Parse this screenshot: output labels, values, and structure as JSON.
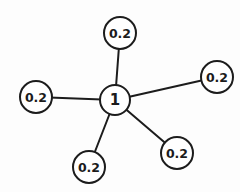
{
  "diagram": {
    "type": "star-graph",
    "background_color": "#fdfdfd",
    "stroke_color": "#1c1c1c",
    "node_fill_color": "#ffffff",
    "center_node": {
      "id": "center",
      "label": "1",
      "x": 115,
      "y": 100,
      "r": 15,
      "font_size": 15
    },
    "outer_nodes": [
      {
        "id": "top",
        "label": "0.2",
        "x": 120,
        "y": 33,
        "r": 16,
        "font_size": 12.5
      },
      {
        "id": "right",
        "label": "0.2",
        "x": 217,
        "y": 77,
        "r": 16,
        "font_size": 12.5
      },
      {
        "id": "left",
        "label": "0.2",
        "x": 36,
        "y": 97,
        "r": 16,
        "font_size": 12.5
      },
      {
        "id": "bottom-left",
        "label": "0.2",
        "x": 89,
        "y": 167,
        "r": 16,
        "font_size": 12.5
      },
      {
        "id": "bottom-right",
        "label": "0.2",
        "x": 177,
        "y": 153,
        "r": 16,
        "font_size": 12.5
      }
    ],
    "edges": [
      {
        "from": "center",
        "to": "top"
      },
      {
        "from": "center",
        "to": "right"
      },
      {
        "from": "center",
        "to": "left"
      },
      {
        "from": "center",
        "to": "bottom-left"
      },
      {
        "from": "center",
        "to": "bottom-right"
      }
    ]
  }
}
